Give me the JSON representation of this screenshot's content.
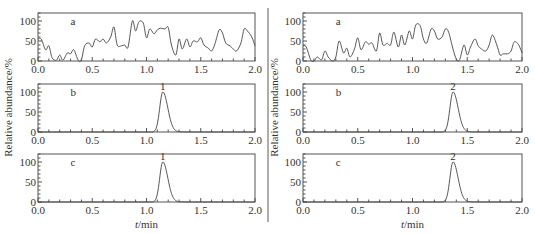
{
  "figure": {
    "ylabel": "Relative abundance/%",
    "xlabel_italic": "t",
    "xlabel_unit": "/min",
    "divider_color": "#777777",
    "line_color": "#444444"
  },
  "chart_data": [
    {
      "type": "line",
      "panel": "left",
      "subplots": [
        {
          "id": "a",
          "label": "a",
          "description": "noise trace",
          "xlim": [
            0.0,
            2.0
          ],
          "ylim": [
            0,
            120
          ],
          "xticks": [
            "0.0",
            "0.5",
            "1.0",
            "1.5",
            "2.0"
          ],
          "yticks": [
            "0",
            "50",
            "100"
          ],
          "x": [
            0.0,
            0.03,
            0.07,
            0.1,
            0.13,
            0.17,
            0.2,
            0.23,
            0.27,
            0.3,
            0.33,
            0.37,
            0.4,
            0.43,
            0.47,
            0.5,
            0.53,
            0.57,
            0.6,
            0.63,
            0.67,
            0.7,
            0.73,
            0.77,
            0.8,
            0.83,
            0.87,
            0.9,
            0.93,
            0.97,
            1.0,
            1.03,
            1.07,
            1.1,
            1.13,
            1.17,
            1.2,
            1.23,
            1.27,
            1.3,
            1.33,
            1.37,
            1.4,
            1.43,
            1.47,
            1.5,
            1.53,
            1.57,
            1.6,
            1.63,
            1.67,
            1.7,
            1.73,
            1.77,
            1.8,
            1.83,
            1.87,
            1.9,
            1.93,
            1.97,
            2.0
          ],
          "y": [
            55,
            55,
            28,
            38,
            8,
            2,
            15,
            2,
            20,
            18,
            28,
            2,
            3,
            38,
            45,
            35,
            55,
            48,
            55,
            45,
            60,
            85,
            40,
            38,
            40,
            35,
            100,
            75,
            98,
            95,
            58,
            80,
            68,
            78,
            82,
            80,
            84,
            40,
            15,
            55,
            30,
            55,
            35,
            50,
            48,
            58,
            40,
            32,
            25,
            42,
            78,
            70,
            45,
            38,
            30,
            25,
            45,
            80,
            75,
            60,
            38
          ],
          "peak_label": null
        },
        {
          "id": "b",
          "label": "b",
          "description": "analyte peak",
          "xlim": [
            0.0,
            2.0
          ],
          "ylim": [
            0,
            120
          ],
          "xticks": [
            "0.0",
            "0.5",
            "1.0",
            "1.5",
            "2.0"
          ],
          "yticks": [
            "0",
            "50",
            "100"
          ],
          "peak_center": 1.15,
          "peak_height": 100,
          "peak_label": "1"
        },
        {
          "id": "c",
          "label": "c",
          "description": "analyte peak",
          "xlim": [
            0.0,
            2.0
          ],
          "ylim": [
            0,
            120
          ],
          "xticks": [
            "0.0",
            "0.5",
            "1.0",
            "1.5",
            "2.0"
          ],
          "yticks": [
            "0",
            "50",
            "100"
          ],
          "peak_center": 1.15,
          "peak_height": 100,
          "peak_label": "1"
        }
      ]
    },
    {
      "type": "line",
      "panel": "right",
      "subplots": [
        {
          "id": "a",
          "label": "a",
          "description": "noise trace",
          "xlim": [
            0.0,
            2.0
          ],
          "ylim": [
            0,
            120
          ],
          "xticks": [
            "0.0",
            "0.5",
            "1.0",
            "1.5",
            "2.0"
          ],
          "yticks": [
            "0",
            "50",
            "100"
          ],
          "x": [
            0.0,
            0.03,
            0.07,
            0.1,
            0.13,
            0.17,
            0.2,
            0.23,
            0.27,
            0.3,
            0.33,
            0.37,
            0.4,
            0.43,
            0.47,
            0.5,
            0.53,
            0.57,
            0.6,
            0.63,
            0.67,
            0.7,
            0.73,
            0.77,
            0.8,
            0.83,
            0.87,
            0.9,
            0.93,
            0.97,
            1.0,
            1.03,
            1.07,
            1.1,
            1.13,
            1.17,
            1.2,
            1.23,
            1.27,
            1.3,
            1.33,
            1.37,
            1.4,
            1.43,
            1.47,
            1.5,
            1.53,
            1.57,
            1.6,
            1.63,
            1.67,
            1.7,
            1.73,
            1.77,
            1.8,
            1.83,
            1.87,
            1.9,
            1.93,
            1.97,
            2.0
          ],
          "y": [
            38,
            35,
            3,
            0,
            10,
            3,
            25,
            10,
            0,
            10,
            50,
            20,
            32,
            10,
            30,
            58,
            28,
            48,
            42,
            45,
            25,
            70,
            40,
            44,
            40,
            72,
            35,
            65,
            40,
            75,
            55,
            90,
            88,
            55,
            45,
            80,
            75,
            55,
            60,
            80,
            72,
            30,
            5,
            3,
            40,
            15,
            35,
            55,
            38,
            30,
            25,
            40,
            65,
            40,
            15,
            18,
            18,
            25,
            48,
            40,
            20
          ],
          "peak_label": null
        },
        {
          "id": "b",
          "label": "b",
          "description": "analyte peak",
          "xlim": [
            0.0,
            2.0
          ],
          "ylim": [
            0,
            120
          ],
          "xticks": [
            "0.0",
            "0.5",
            "1.0",
            "1.5",
            "2.0"
          ],
          "yticks": [
            "0",
            "50",
            "100"
          ],
          "peak_center": 1.37,
          "peak_height": 100,
          "peak_label": "2"
        },
        {
          "id": "c",
          "label": "c",
          "description": "analyte peak",
          "xlim": [
            0.0,
            2.0
          ],
          "ylim": [
            0,
            120
          ],
          "xticks": [
            "0.0",
            "0.5",
            "1.0",
            "1.5",
            "2.0"
          ],
          "yticks": [
            "0",
            "50",
            "100"
          ],
          "peak_center": 1.37,
          "peak_height": 100,
          "peak_label": "2"
        }
      ]
    }
  ]
}
